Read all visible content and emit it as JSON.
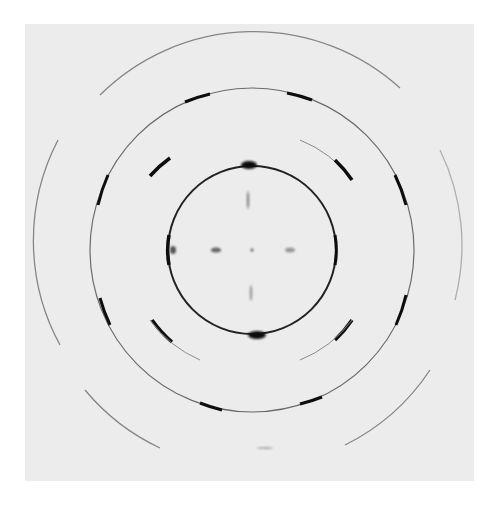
{
  "figure": {
    "background_color": "#ececec",
    "ink_color": "#1a1a1a",
    "center": [
      252,
      250
    ],
    "rings": [
      {
        "name": "inner-ring",
        "radius": 84,
        "intensity": "strong"
      },
      {
        "name": "intermediate-ring",
        "radius": 121,
        "intensity": "faint-partial"
      },
      {
        "name": "middle-ring",
        "radius": 162,
        "intensity": "medium"
      },
      {
        "name": "outer-ring",
        "radius": 218,
        "intensity": "faint"
      }
    ],
    "spots": [
      {
        "name": "center-spot",
        "position": [
          252,
          250
        ]
      },
      {
        "name": "left-equatorial-spot",
        "position": [
          216,
          250
        ]
      },
      {
        "name": "right-equatorial-spot",
        "position": [
          290,
          250
        ]
      },
      {
        "name": "top-meridional-streak",
        "position": [
          248,
          200
        ]
      },
      {
        "name": "bottom-meridional-streak",
        "position": [
          251,
          293
        ]
      }
    ]
  }
}
